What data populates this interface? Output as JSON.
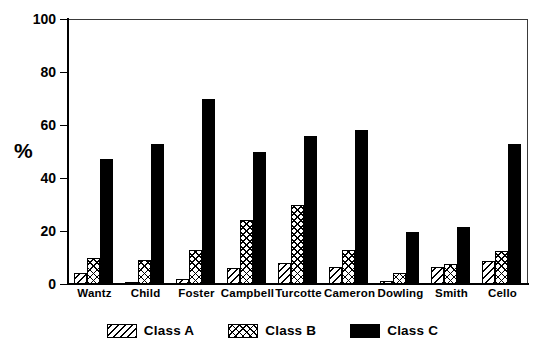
{
  "chart_data": {
    "type": "bar",
    "title": "",
    "subtitle": "",
    "xlabel": "",
    "ylabel": "%",
    "ylim": [
      0,
      100
    ],
    "yticks": [
      0,
      20,
      40,
      60,
      80,
      100
    ],
    "ytick_labels": [
      "0",
      "20",
      "40",
      "60",
      "80",
      "100"
    ],
    "grid": false,
    "legend_position": "bottom-center",
    "categories": [
      "Wantz",
      "Child",
      "Foster",
      "Campbell",
      "Turcotte",
      "Cameron",
      "Dowling",
      "Smith",
      "Cello"
    ],
    "series": [
      {
        "name": "Class A",
        "pattern": "diagonal-hatch",
        "color": "#000000",
        "fill": "#ffffff",
        "values": [
          4,
          0.7,
          2,
          6,
          8,
          6.5,
          1,
          6.5,
          8.5
        ]
      },
      {
        "name": "Class B",
        "pattern": "cross-hatch",
        "color": "#000000",
        "fill": "#ffffff",
        "values": [
          10,
          9,
          13,
          24,
          30,
          13,
          4,
          7.5,
          12.5
        ]
      },
      {
        "name": "Class C",
        "pattern": "solid",
        "color": "#000000",
        "fill": "#000000",
        "values": [
          47,
          53,
          70,
          50,
          56,
          58,
          19.5,
          21.5,
          53
        ]
      }
    ]
  },
  "axis": {
    "y_label": "%",
    "tick_labels": [
      "100",
      "80",
      "60",
      "40",
      "20",
      "0"
    ]
  },
  "legend": {
    "items": [
      {
        "label": "Class A",
        "swatch": "diagonal-hatch-swatch"
      },
      {
        "label": "Class B",
        "swatch": "cross-hatch-swatch"
      },
      {
        "label": "Class C",
        "swatch": "solid-black-swatch"
      }
    ]
  },
  "colors": {
    "ink": "#000000",
    "frame": "#3a3a3a",
    "background": "#ffffff"
  }
}
